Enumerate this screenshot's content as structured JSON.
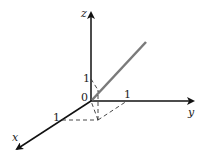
{
  "diagram": {
    "type": "3d-coordinate-axes",
    "axes": {
      "x": {
        "label": "x"
      },
      "y": {
        "label": "y"
      },
      "z": {
        "label": "z"
      }
    },
    "origin_label": "0",
    "tick_labels": {
      "x": "1",
      "y": "1",
      "z": "1"
    },
    "colors": {
      "axis": "#111111",
      "vector_line": "#7a7a7a",
      "dashed": "#333333"
    }
  }
}
